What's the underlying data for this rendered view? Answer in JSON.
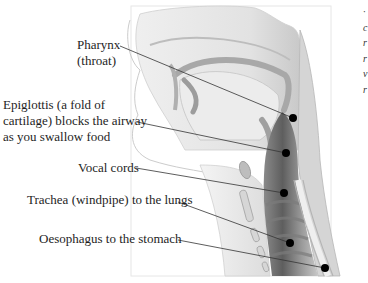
{
  "diagram": {
    "type": "anatomical cross-section",
    "labels": [
      {
        "id": "pharynx",
        "lines": [
          "Pharynx",
          "(throat)"
        ],
        "anchor": [
          293,
          118
        ]
      },
      {
        "id": "epiglottis",
        "lines": [
          "Epiglottis (a fold of",
          "cartilage) blocks the airway",
          "as you swallow food"
        ],
        "anchor": [
          286,
          153
        ]
      },
      {
        "id": "vocal-cords",
        "lines": [
          "Vocal cords"
        ],
        "anchor": [
          284,
          193
        ]
      },
      {
        "id": "trachea",
        "lines": [
          "Trachea (windpipe) to the lungs"
        ],
        "anchor": [
          290,
          243
        ]
      },
      {
        "id": "oesophagus",
        "lines": [
          "Oesophagus to the stomach"
        ],
        "anchor": [
          325,
          268
        ]
      }
    ],
    "colors": {
      "leader_line": "#333333",
      "dot": "#000000",
      "tissue_light": "#e4e4e4",
      "tissue_mid": "#b8b8b8",
      "tissue_dark": "#6e6e6e"
    }
  },
  "side_note": {
    "visible_fragments": [
      "·",
      "c",
      "r",
      "r",
      "v",
      "r"
    ]
  }
}
